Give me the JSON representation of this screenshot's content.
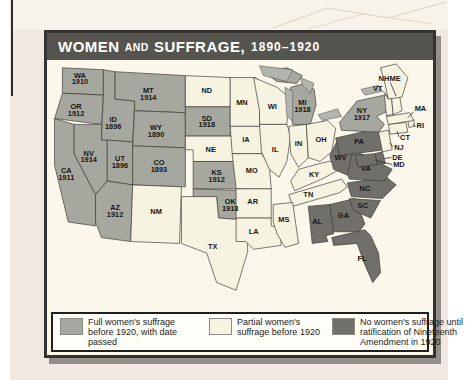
{
  "title": {
    "part1": "WOMEN",
    "and": "AND",
    "part2": "SUFFRAGE,",
    "years": "1890–1920"
  },
  "colors": {
    "full": "#a6a89f",
    "partial": "#f7f3e1",
    "none": "#716f6a",
    "water": "#b3b4ac",
    "title_bar": "#56544e",
    "map_background": "#fbf7ea"
  },
  "legend": [
    {
      "key": "full",
      "label": "Full women's suffrage before 1920, with date passed"
    },
    {
      "key": "partial",
      "label": "Partial women's suffrage before 1920"
    },
    {
      "key": "none",
      "label": "No women's suffrage until ratification of Nineteenth Amendment in 1920"
    }
  ],
  "states": [
    {
      "abbr": "WA",
      "date": "1910",
      "category": "full"
    },
    {
      "abbr": "OR",
      "date": "1912",
      "category": "full"
    },
    {
      "abbr": "CA",
      "date": "1911",
      "category": "full"
    },
    {
      "abbr": "ID",
      "date": "1896",
      "category": "full"
    },
    {
      "abbr": "NV",
      "date": "1914",
      "category": "full"
    },
    {
      "abbr": "MT",
      "date": "1914",
      "category": "full"
    },
    {
      "abbr": "WY",
      "date": "1890",
      "category": "full"
    },
    {
      "abbr": "UT",
      "date": "1896",
      "category": "full"
    },
    {
      "abbr": "CO",
      "date": "1893",
      "category": "full"
    },
    {
      "abbr": "AZ",
      "date": "1912",
      "category": "full"
    },
    {
      "abbr": "NM",
      "category": "partial"
    },
    {
      "abbr": "ND",
      "category": "partial"
    },
    {
      "abbr": "SD",
      "date": "1918",
      "category": "full"
    },
    {
      "abbr": "NE",
      "category": "partial"
    },
    {
      "abbr": "KS",
      "date": "1912",
      "category": "full"
    },
    {
      "abbr": "OK",
      "date": "1918",
      "category": "full"
    },
    {
      "abbr": "TX",
      "category": "partial"
    },
    {
      "abbr": "MN",
      "category": "partial"
    },
    {
      "abbr": "IA",
      "category": "partial"
    },
    {
      "abbr": "MO",
      "category": "partial"
    },
    {
      "abbr": "AR",
      "category": "partial"
    },
    {
      "abbr": "LA",
      "category": "partial"
    },
    {
      "abbr": "WI",
      "category": "partial"
    },
    {
      "abbr": "IL",
      "category": "partial"
    },
    {
      "abbr": "MI",
      "date": "1918",
      "category": "full"
    },
    {
      "abbr": "IN",
      "category": "partial"
    },
    {
      "abbr": "OH",
      "category": "partial"
    },
    {
      "abbr": "KY",
      "category": "partial"
    },
    {
      "abbr": "TN",
      "category": "partial"
    },
    {
      "abbr": "MS",
      "category": "partial"
    },
    {
      "abbr": "AL",
      "category": "none"
    },
    {
      "abbr": "GA",
      "category": "none"
    },
    {
      "abbr": "FL",
      "category": "none"
    },
    {
      "abbr": "SC",
      "category": "none"
    },
    {
      "abbr": "NC",
      "category": "none"
    },
    {
      "abbr": "VA",
      "category": "none"
    },
    {
      "abbr": "WV",
      "category": "none"
    },
    {
      "abbr": "PA",
      "category": "none"
    },
    {
      "abbr": "NY",
      "date": "1917",
      "category": "full"
    },
    {
      "abbr": "NJ",
      "category": "partial"
    },
    {
      "abbr": "DE",
      "category": "none"
    },
    {
      "abbr": "MD",
      "category": "none"
    },
    {
      "abbr": "CT",
      "category": "partial"
    },
    {
      "abbr": "RI",
      "category": "partial"
    },
    {
      "abbr": "MA",
      "category": "partial"
    },
    {
      "abbr": "VT",
      "category": "partial"
    },
    {
      "abbr": "NH",
      "category": "partial"
    },
    {
      "abbr": "ME",
      "category": "partial"
    }
  ]
}
